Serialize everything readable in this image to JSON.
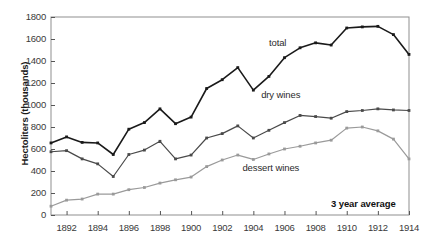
{
  "chart_data": {
    "type": "line",
    "title": "",
    "xlabel": "",
    "ylabel": "Hectoliters (thousands)",
    "ylim": [
      0,
      1800
    ],
    "xlim": [
      1891,
      1914
    ],
    "grid": false,
    "legend_position": "inline-annotations",
    "annotations": [
      "3 year average"
    ],
    "note": "3 year average",
    "y_ticks": [
      0,
      200,
      400,
      600,
      800,
      1000,
      1200,
      1400,
      1600,
      1800
    ],
    "x_ticks": [
      1892,
      1894,
      1896,
      1898,
      1900,
      1902,
      1904,
      1906,
      1908,
      1910,
      1912,
      1914
    ],
    "x": [
      1891,
      1892,
      1893,
      1894,
      1895,
      1896,
      1897,
      1898,
      1899,
      1900,
      1901,
      1902,
      1903,
      1904,
      1905,
      1906,
      1907,
      1908,
      1909,
      1910,
      1911,
      1912,
      1913,
      1914
    ],
    "series": [
      {
        "name": "total",
        "color": "#1a1a1a",
        "label": "total",
        "label_x": 1905.0,
        "label_y": 1560,
        "values": [
          655,
          710,
          660,
          655,
          550,
          780,
          840,
          965,
          830,
          890,
          1150,
          1230,
          1340,
          1135,
          1260,
          1430,
          1520,
          1565,
          1545,
          1700,
          1710,
          1715,
          1640,
          1460
        ]
      },
      {
        "name": "dry wines",
        "color": "#4a4a4a",
        "label": "dry wines",
        "label_x": 1904.5,
        "label_y": 1090,
        "values": [
          575,
          585,
          510,
          465,
          350,
          550,
          590,
          670,
          510,
          545,
          700,
          740,
          810,
          700,
          770,
          840,
          905,
          895,
          880,
          940,
          950,
          965,
          955,
          950
        ]
      },
      {
        "name": "dessert wines",
        "color": "#9a9a9a",
        "label": "dessert wines",
        "label_x": 1903.3,
        "label_y": 430,
        "values": [
          80,
          135,
          145,
          190,
          190,
          230,
          250,
          290,
          320,
          345,
          440,
          500,
          545,
          505,
          555,
          600,
          625,
          655,
          680,
          790,
          800,
          765,
          690,
          510
        ]
      }
    ]
  },
  "axis": {
    "y_title": "Hectoliters (thousands)"
  }
}
